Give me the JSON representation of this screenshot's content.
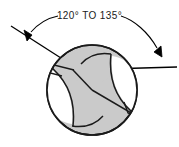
{
  "figure": {
    "kind": "engineering-drawing",
    "background_color": "#ffffff"
  },
  "dimension": {
    "label": "120° TO 135°",
    "min_angle": "120°",
    "max_angle": "135°",
    "separator": "TO",
    "text_color": "#1a1a1a",
    "leader_color": "#000000",
    "arrowhead_count": 2
  },
  "drill": {
    "body_fill": "#cacaca",
    "outline_color": "#1a1a1a",
    "outline_width": 1.6,
    "flute_count": 2,
    "features": [
      "circular-outline",
      "left-flute",
      "right-flute",
      "chisel-edge",
      "left-cutting-lip",
      "right-cutting-lip",
      "left-margin-land",
      "right-margin-land"
    ]
  },
  "angle_lines": {
    "left_line_label": "left-cutting-lip-extension",
    "right_line_label": "right-cutting-lip-extension",
    "color": "#000000"
  }
}
